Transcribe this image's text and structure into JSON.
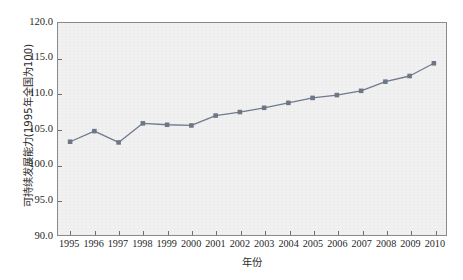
{
  "chart_data": {
    "type": "line",
    "title": "",
    "xlabel": "年份",
    "ylabel": "可持续发展能力(1995年全国为100)",
    "categories": [
      "1995",
      "1996",
      "1997",
      "1998",
      "1999",
      "2000",
      "2001",
      "2002",
      "2003",
      "2004",
      "2005",
      "2006",
      "2007",
      "2008",
      "2009",
      "2010"
    ],
    "values": [
      103.2,
      104.7,
      103.1,
      105.8,
      105.6,
      105.5,
      106.9,
      107.4,
      108.0,
      108.7,
      109.4,
      109.8,
      110.4,
      111.7,
      112.5,
      114.3
    ],
    "series": [
      {
        "name": "可持续发展能力",
        "values": [
          103.2,
          104.7,
          103.1,
          105.8,
          105.6,
          105.5,
          106.9,
          107.4,
          108.0,
          108.7,
          109.4,
          109.8,
          110.4,
          111.7,
          112.5,
          114.3
        ]
      }
    ],
    "ylim": [
      90.0,
      120.0
    ],
    "yticks": [
      "90.0",
      "95.0",
      "100.0",
      "105.0",
      "110.0",
      "115.0",
      "120.0"
    ],
    "ytick_values": [
      90.0,
      95.0,
      100.0,
      105.0,
      110.0,
      115.0,
      120.0
    ],
    "grid": false,
    "legend": "none",
    "marker": "square",
    "line_color": "#707a8c",
    "marker_color": "#6c7686",
    "plot_background": "#f1f1f1",
    "axis_color": "#8a8a8a"
  }
}
